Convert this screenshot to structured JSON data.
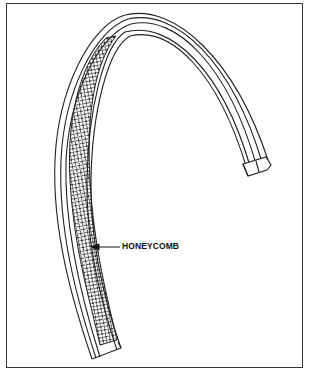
{
  "figure": {
    "callouts": [
      {
        "label": "HONEYCOMB",
        "target": "honeycomb core on inner face of curved member"
      }
    ]
  },
  "colors": {
    "line": "#222222",
    "background": "#ffffff",
    "border": "#333333"
  }
}
